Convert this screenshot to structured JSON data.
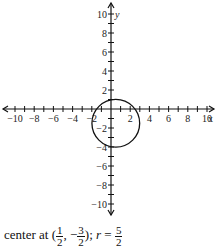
{
  "chart_data": {
    "type": "scatter",
    "subtype": "circle-on-cartesian-plane",
    "title": "",
    "xlabel": "x",
    "ylabel": "y",
    "xlim": [
      -10,
      10
    ],
    "ylim": [
      -10,
      10
    ],
    "x_ticks": [
      -10,
      -8,
      -6,
      -4,
      -2,
      2,
      4,
      6,
      8,
      10
    ],
    "y_ticks": [
      10,
      8,
      6,
      4,
      2,
      -2,
      -4,
      -6,
      -8,
      -10
    ],
    "minor_tick_step": 1,
    "grid": false,
    "circle": {
      "center": [
        0.5,
        -1.5
      ],
      "radius": 2.5
    },
    "caption": "center at (1/2, -3/2); r = 5/2"
  },
  "axes": {
    "x_label": "x",
    "y_label": "y"
  },
  "caption": {
    "prefix": "center at (",
    "cx_num": "1",
    "cx_den": "2",
    "sep": ", −",
    "cy_num": "3",
    "cy_den": "2",
    "mid": "); ",
    "r_label": "r",
    "eq": " = ",
    "r_num": "5",
    "r_den": "2"
  }
}
